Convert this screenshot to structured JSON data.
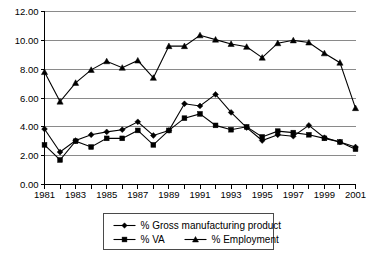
{
  "chart_data": {
    "type": "line",
    "title": "",
    "subtitle": "",
    "xlabel": "",
    "ylabel": "",
    "ylim": [
      0,
      12
    ],
    "ytick_step": 2,
    "ytick_labels": [
      "0.00",
      "2.00",
      "4.00",
      "6.00",
      "8.00",
      "10.00",
      "12.00"
    ],
    "ytick_values": [
      0,
      2,
      4,
      6,
      8,
      10,
      12
    ],
    "grid": "horizontal",
    "legend_position": "bottom",
    "x": [
      1981,
      1982,
      1983,
      1984,
      1985,
      1986,
      1987,
      1988,
      1989,
      1990,
      1991,
      1992,
      1993,
      1994,
      1995,
      1996,
      1997,
      1998,
      1999,
      2000,
      2001
    ],
    "xtick_labels": [
      "1981",
      "1983",
      "1985",
      "1987",
      "1989",
      "1991",
      "1993",
      "1995",
      "1997",
      "1999",
      "2001"
    ],
    "xtick_label_values": [
      1981,
      1983,
      1985,
      1987,
      1989,
      1991,
      1993,
      1995,
      1997,
      1999,
      2001
    ],
    "xlim": [
      1981,
      2001
    ],
    "series": [
      {
        "name": "% Gross manufacturing product",
        "marker": "diamond",
        "color": "#000000",
        "values": [
          3.85,
          2.25,
          3.05,
          3.45,
          3.65,
          3.8,
          4.35,
          3.4,
          3.75,
          5.6,
          5.45,
          6.25,
          5.0,
          3.95,
          3.05,
          3.45,
          3.35,
          4.1,
          3.25,
          2.95,
          2.6
        ]
      },
      {
        "name": "% VA",
        "marker": "square",
        "color": "#000000",
        "values": [
          2.75,
          1.7,
          3.0,
          2.6,
          3.2,
          3.2,
          3.75,
          2.75,
          3.75,
          4.6,
          4.9,
          4.1,
          3.8,
          4.0,
          3.3,
          3.7,
          3.6,
          3.45,
          3.2,
          2.95,
          2.45
        ]
      },
      {
        "name": "% Employment",
        "marker": "triangle",
        "color": "#000000",
        "values": [
          7.8,
          5.75,
          7.05,
          7.95,
          8.55,
          8.1,
          8.6,
          7.4,
          9.6,
          9.6,
          10.35,
          10.05,
          9.75,
          9.55,
          8.8,
          9.8,
          10.0,
          9.85,
          9.1,
          8.45,
          5.3
        ]
      }
    ]
  },
  "legend": {
    "entries": [
      {
        "label": "% Gross manufacturing product",
        "marker": "diamond"
      },
      {
        "label": "% VA",
        "marker": "square"
      },
      {
        "label": "% Employment",
        "marker": "triangle"
      }
    ]
  }
}
